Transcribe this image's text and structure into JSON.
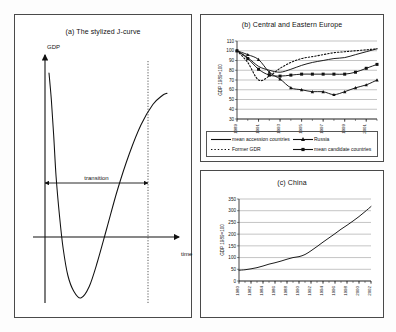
{
  "figure": {
    "background": "#fdfdfd",
    "ink": "#111111"
  },
  "panel_a": {
    "title": "(a) The stylized J-curve",
    "y_axis_label": "GDP",
    "x_axis_label": "time",
    "annotation": "transition"
  },
  "panel_b": {
    "title": "(b) Central and Eastern Europe",
    "y_axis_label": "GDP 1989=100",
    "legend": [
      {
        "label": "mean accession countries",
        "style": "solid",
        "marker": "none"
      },
      {
        "label": "Russia",
        "style": "solid",
        "marker": "triangle"
      },
      {
        "label": "Former GDR",
        "style": "dotted",
        "marker": "none"
      },
      {
        "label": "mean candidate countries",
        "style": "solid",
        "marker": "square"
      }
    ]
  },
  "panel_c": {
    "title": "(c) China",
    "y_axis_label": "GDP 1989=100"
  },
  "chart_data": [
    {
      "id": "panel-a-jcurve",
      "type": "line",
      "title": "(a) The stylized J-curve",
      "xlabel": "time",
      "ylabel": "GDP",
      "grid": false,
      "legend": "none",
      "annotations": [
        {
          "text": "transition",
          "type": "double-arrow-span"
        }
      ],
      "series": [
        {
          "name": "stylized J-curve",
          "x": [
            0,
            2,
            4,
            6,
            9,
            12,
            16,
            21,
            27,
            34,
            41,
            49,
            58,
            68,
            78,
            88,
            96,
            100
          ],
          "y": [
            100,
            88,
            72,
            54,
            36,
            22,
            10,
            3,
            0,
            5,
            16,
            31,
            48,
            64,
            77,
            86,
            90,
            91
          ]
        }
      ]
    },
    {
      "id": "panel-b-cee",
      "type": "line",
      "title": "(b) Central and Eastern Europe",
      "xlabel": "",
      "ylabel": "GDP 1989=100",
      "ylim": [
        30,
        110
      ],
      "yticks": [
        30,
        40,
        50,
        60,
        70,
        80,
        90,
        100,
        110
      ],
      "x": [
        1989,
        1990,
        1991,
        1992,
        1993,
        1994,
        1995,
        1996,
        1997,
        1998,
        1999,
        2000,
        2001,
        2002
      ],
      "xticks": [
        1989,
        1991,
        1993,
        1995,
        1997,
        1999,
        2001
      ],
      "grid": true,
      "legend_position": "bottom",
      "series": [
        {
          "name": "mean accession countries",
          "style": "solid",
          "marker": "none",
          "values": [
            100,
            93,
            84,
            80,
            78,
            81,
            85,
            88,
            90,
            92,
            93,
            96,
            99,
            102
          ]
        },
        {
          "name": "Russia",
          "style": "solid",
          "marker": "triangle",
          "values": [
            100,
            96,
            91,
            78,
            71,
            62,
            60,
            58,
            58,
            55,
            58,
            62,
            65,
            70
          ]
        },
        {
          "name": "Former GDR",
          "style": "dotted",
          "marker": "none",
          "values": [
            100,
            88,
            70,
            74,
            82,
            88,
            92,
            94,
            96,
            98,
            99,
            100,
            101,
            102
          ]
        },
        {
          "name": "mean candidate countries",
          "style": "solid",
          "marker": "square",
          "values": [
            100,
            92,
            81,
            75,
            74,
            75,
            76,
            76,
            76,
            76,
            76,
            78,
            82,
            86
          ]
        }
      ]
    },
    {
      "id": "panel-c-china",
      "type": "line",
      "title": "(c) China",
      "xlabel": "",
      "ylabel": "GDP 1989=100",
      "ylim": [
        0,
        350
      ],
      "yticks": [
        0,
        50,
        100,
        150,
        200,
        250,
        300,
        350
      ],
      "x": [
        1980,
        1981,
        1982,
        1983,
        1984,
        1985,
        1986,
        1987,
        1988,
        1989,
        1990,
        1991,
        1992,
        1993,
        1994,
        1995,
        1996,
        1997,
        1998,
        1999,
        2000,
        2001,
        2002
      ],
      "xticks": [
        1980,
        1982,
        1984,
        1986,
        1988,
        1990,
        1992,
        1994,
        1996,
        1998,
        2000,
        2002
      ],
      "grid": true,
      "legend_position": "none",
      "series": [
        {
          "name": "China GDP index",
          "style": "solid",
          "marker": "none",
          "values": [
            46,
            48,
            52,
            57,
            64,
            72,
            78,
            85,
            93,
            100,
            104,
            113,
            129,
            147,
            166,
            184,
            202,
            221,
            238,
            256,
            275,
            296,
            318
          ]
        }
      ]
    }
  ]
}
